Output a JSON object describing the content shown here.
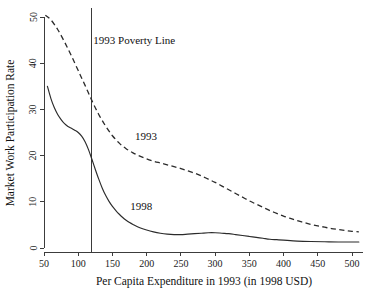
{
  "chart_data": {
    "type": "line",
    "title": "",
    "xlabel": "Per Capita Expenditure in 1993 (in 1998 USD)",
    "ylabel": "Market Work Participation Rate",
    "xlim": [
      33,
      520
    ],
    "ylim": [
      -1.5,
      52
    ],
    "grid": false,
    "legend_position": "inline-annotations",
    "xticks": [
      50,
      100,
      150,
      200,
      250,
      300,
      350,
      400,
      450,
      500
    ],
    "xticklabels": [
      "50",
      "100",
      "150",
      "200",
      "250",
      "300",
      "350",
      "400",
      "450",
      "500"
    ],
    "yticks": [
      0,
      10,
      20,
      30,
      40,
      50
    ],
    "yticklabels": [
      "0",
      "10",
      "20",
      "30",
      "40",
      "50"
    ],
    "annotations": [
      {
        "name": "poverty-line-label",
        "text": "1993 Poverty Line",
        "x": 122,
        "y": 44.2
      },
      {
        "name": "series-label-1993",
        "text": "1993",
        "x": 183,
        "y": 23.4
      },
      {
        "name": "series-label-1998",
        "text": "1998",
        "x": 176,
        "y": 8.2
      }
    ],
    "reference_lines": [
      {
        "name": "poverty-line-1993",
        "orientation": "vertical",
        "x": 120,
        "style": "solid",
        "label": "1993 Poverty Line"
      }
    ],
    "series": [
      {
        "name": "1993",
        "style": "dashed",
        "color": "#2b2b2b",
        "x": [
          52,
          60,
          70,
          80,
          90,
          100,
          110,
          120,
          130,
          140,
          150,
          160,
          170,
          180,
          190,
          200,
          210,
          220,
          230,
          240,
          250,
          260,
          270,
          280,
          290,
          300,
          310,
          320,
          330,
          340,
          350,
          360,
          370,
          380,
          390,
          400,
          410,
          420,
          430,
          440,
          450,
          460,
          470,
          480,
          490,
          500,
          510
        ],
        "y": [
          50.4,
          49.4,
          47.3,
          44.6,
          41.6,
          38.4,
          35.2,
          31.9,
          28.9,
          26.4,
          24.3,
          22.7,
          21.5,
          20.6,
          19.9,
          19.3,
          18.8,
          18.4,
          18.0,
          17.6,
          17.2,
          16.7,
          16.2,
          15.6,
          14.9,
          14.2,
          13.4,
          12.6,
          11.8,
          11.0,
          10.2,
          9.5,
          8.8,
          8.1,
          7.5,
          6.9,
          6.4,
          5.9,
          5.5,
          5.1,
          4.8,
          4.5,
          4.2,
          4.0,
          3.8,
          3.6,
          3.5
        ]
      },
      {
        "name": "1998",
        "style": "solid",
        "color": "#2b2b2b",
        "x": [
          55,
          60,
          65,
          70,
          75,
          80,
          85,
          90,
          95,
          100,
          105,
          110,
          115,
          120,
          125,
          130,
          135,
          140,
          145,
          150,
          155,
          160,
          165,
          170,
          175,
          180,
          190,
          200,
          210,
          220,
          230,
          240,
          250,
          260,
          270,
          280,
          290,
          300,
          310,
          320,
          330,
          340,
          350,
          360,
          370,
          380,
          390,
          400,
          420,
          440,
          460,
          480,
          500,
          510
        ],
        "y": [
          35.0,
          32.4,
          30.4,
          28.9,
          27.8,
          26.9,
          26.3,
          25.9,
          25.5,
          25.0,
          24.2,
          23.0,
          21.3,
          19.2,
          17.0,
          14.9,
          13.0,
          11.4,
          10.1,
          9.0,
          8.1,
          7.3,
          6.6,
          6.0,
          5.5,
          5.1,
          4.4,
          3.9,
          3.5,
          3.2,
          3.0,
          2.9,
          2.9,
          3.0,
          3.1,
          3.2,
          3.3,
          3.3,
          3.2,
          3.1,
          2.9,
          2.7,
          2.5,
          2.3,
          2.1,
          1.9,
          1.8,
          1.7,
          1.5,
          1.4,
          1.35,
          1.3,
          1.3,
          1.3
        ]
      }
    ]
  },
  "axes": {
    "x_title": "Per Capita Expenditure in 1993 (in 1998 USD)",
    "y_title": "Market Work Participation Rate"
  }
}
